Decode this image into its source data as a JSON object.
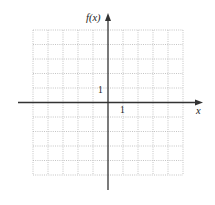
{
  "graph": {
    "y_axis_label": "f(x)",
    "x_axis_label": "x",
    "x_tick_label": "1",
    "y_tick_label": "1",
    "grid": {
      "columns": 10,
      "rows": 10,
      "style": "dotted",
      "color": "#b8b8b8"
    },
    "axis_color": "#333333"
  }
}
